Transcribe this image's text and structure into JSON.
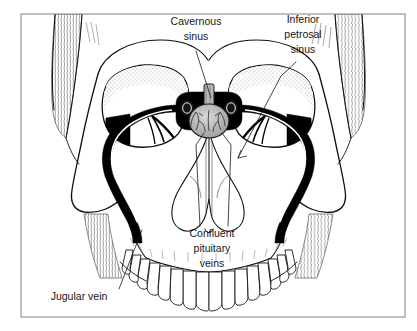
{
  "figure": {
    "type": "anatomical-line-illustration",
    "border_color": "#8d8d8d",
    "background_color": "#ffffff",
    "ink_color": "#111111",
    "vein_fill_color": "#000000"
  },
  "labels": [
    {
      "id": "cavernous-sinus",
      "line1": "Cavernous",
      "line2": "sinus",
      "text_x": 196,
      "text_y": 33,
      "leader": "M 196 51 L 211 98"
    },
    {
      "id": "inferior-petrosal-sinus",
      "line1": "Inferior",
      "line2": "petrosal",
      "line3": "sinus",
      "text_x": 303,
      "text_y": 30,
      "leader": "M 296 62 L 281 76 L 238 158"
    },
    {
      "id": "confluent-pituitary-veins",
      "line1": "Confluent",
      "line2": "pituitary",
      "line3": "veins",
      "text_x": 212,
      "text_y": 237,
      "leader_a": "M 200 226 L 196 145 L 204 133",
      "leader_b": "M 228 226 L 231 145 L 222 133"
    },
    {
      "id": "jugular-vein",
      "line1": "Jugular vein",
      "text_x": 79,
      "text_y": 297,
      "leader": "M 119 289 L 142 230"
    }
  ],
  "structures": {
    "skull": "frontal view cranium with orbits, nasal aperture, maxilla and upper dental arch",
    "temporalis_left": "hatched temporal muscle strip, upper left",
    "temporalis_right": "hatched temporal muscle strip, upper right",
    "orbit_left": "left orbital cavity with stippled superior rim",
    "orbit_right": "right orbital cavity with stippled superior rim",
    "pituitary_gland": "central ovoid gland with branching surface vessels",
    "cavernous_sinus_left": "dark oval sinus left of pituitary",
    "cavernous_sinus_right": "dark oval sinus right of pituitary",
    "infundibulum": "vertical pituitary stalk above gland",
    "nasal_cavity": "cross-hatched nasal aperture below sella",
    "venous_channel_left": "black inferior petrosal / jugular channel, left",
    "venous_channel_right": "black inferior petrosal / jugular channel, right",
    "teeth_count": 16
  }
}
